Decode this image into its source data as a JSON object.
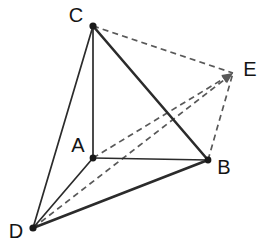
{
  "figure": {
    "background_color": "#ffffff",
    "width": 271,
    "height": 251,
    "solid_color": "#2b2b2b",
    "dashed_color": "#595959",
    "label_color": "#141414"
  },
  "vertices": [
    {
      "id": "A",
      "label": "A",
      "x": 93,
      "y": 158,
      "label_x": 78,
      "label_y": 147,
      "dot_r": 3.4
    },
    {
      "id": "B",
      "label": "B",
      "x": 208,
      "y": 160,
      "label_x": 224,
      "label_y": 169,
      "dot_r": 3.4
    },
    {
      "id": "C",
      "label": "C",
      "x": 93,
      "y": 26,
      "label_x": 76,
      "label_y": 17,
      "dot_r": 3.6
    },
    {
      "id": "D",
      "label": "D",
      "x": 33,
      "y": 228,
      "label_x": 16,
      "label_y": 233,
      "dot_r": 3.6
    },
    {
      "id": "E",
      "label": "E",
      "x": 233,
      "y": 73,
      "label_x": 250,
      "label_y": 71,
      "dot_r": 0
    }
  ],
  "edges_solid": [
    {
      "name": "edge-C-A",
      "from": "C",
      "to": "A",
      "weight": "thin"
    },
    {
      "name": "edge-C-B",
      "from": "C",
      "to": "B",
      "weight": "thick"
    },
    {
      "name": "edge-C-D",
      "from": "C",
      "to": "D",
      "weight": "thin"
    },
    {
      "name": "edge-A-B",
      "from": "A",
      "to": "B",
      "weight": "thin"
    },
    {
      "name": "edge-A-D",
      "from": "A",
      "to": "D",
      "weight": "thin"
    },
    {
      "name": "edge-D-B",
      "from": "D",
      "to": "B",
      "weight": "thick"
    }
  ],
  "edges_dashed": [
    {
      "name": "edge-C-E",
      "from": "C",
      "to": "E",
      "arrow": false
    },
    {
      "name": "edge-B-E",
      "from": "B",
      "to": "E",
      "arrow": false
    },
    {
      "name": "edge-A-E",
      "from": "A",
      "to": "E",
      "arrow": true
    },
    {
      "name": "edge-D-E",
      "from": "D",
      "to": "E",
      "arrow": true
    }
  ]
}
